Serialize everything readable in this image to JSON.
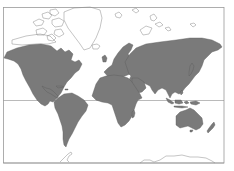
{
  "map": {
    "projection": "Mercator",
    "colors": {
      "land": "#7a7a7a",
      "ocean": "#ffffff",
      "ice_outline": "#8a8a8a",
      "frame": "#9a9a9a",
      "equator": "#8c8c8c"
    },
    "features": [
      "north-america",
      "south-america",
      "greenland-outline",
      "arctic-islands-outline",
      "europe",
      "africa",
      "asia",
      "australia",
      "new-zealand",
      "indonesia",
      "japan",
      "antarctica-outline",
      "equator-line"
    ]
  }
}
